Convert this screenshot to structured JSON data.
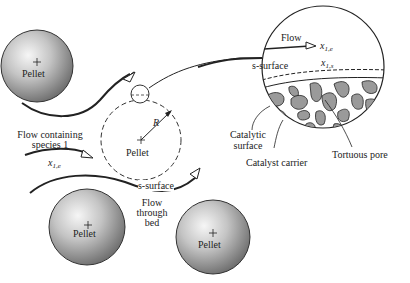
{
  "diagram": {
    "pellets": [
      {
        "label": "Pellet",
        "cx": 37,
        "cy": 66,
        "r": 36
      },
      {
        "label": "Pellet",
        "cx": 87,
        "cy": 227,
        "r": 38
      },
      {
        "label": "Pellet",
        "cx": 213,
        "cy": 237,
        "r": 37
      }
    ],
    "focus_pellet": {
      "label": "Pellet",
      "radius_label": "R"
    },
    "labels": {
      "flow_containing": "Flow containing",
      "species": "species 1",
      "x1e_left": "x",
      "x1e_left_sub": "1,e",
      "s_surface": "s-surface",
      "flow_through_1": "Flow",
      "flow_through_2": "through",
      "flow_through_3": "bed",
      "catalytic_1": "Catalytic",
      "catalytic_2": "surface",
      "catalyst_carrier": "Catalyst carrier",
      "tortuous_pore": "Tortuous pore"
    },
    "detail": {
      "flow": "Flow",
      "x1e": "x",
      "x1e_sub": "1,e",
      "s_surface": "s-surface",
      "x1s": "x",
      "x1s_sub": "1,s"
    },
    "colors": {
      "stroke": "#222222",
      "pore_fill": "#9a9a9a",
      "pellet_light": "#f4f4f4",
      "pellet_dark": "#6e6e6e"
    }
  }
}
